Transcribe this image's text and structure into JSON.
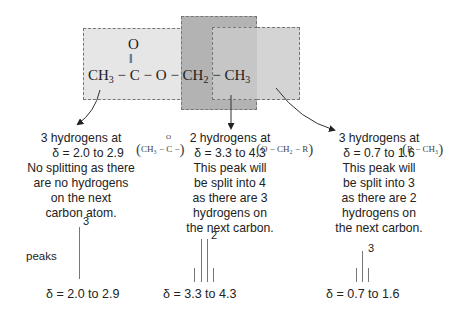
{
  "molecule": {
    "left_ch3": "CH",
    "left_ch3_sub": "3",
    "bond1": "−",
    "carbon": "C",
    "carbonyl_o": "O",
    "double_bond": "‖",
    "bond2": "−",
    "ester_o": "O",
    "bond3": "−",
    "ch2": "CH",
    "ch2_sub": "2",
    "bond4": "−",
    "right_ch3": "CH",
    "right_ch3_sub": "3"
  },
  "colors": {
    "light_box": "#e6e6e6",
    "dark_box": "#b3b3b3",
    "mid_box": "#d4d4d4",
    "dash": "#777777",
    "peak": "#777777"
  },
  "groups": [
    {
      "title": "3 hydrogens at",
      "delta_line": "δ = 2.0 to 2.9",
      "formula": "CH₃ − C −",
      "formula_top": "O",
      "lines": [
        "No splitting as there",
        "are no hydrogens",
        "on the next",
        "carbon atom."
      ],
      "peak_count_label": "3",
      "range": "δ = 2.0 to 2.9"
    },
    {
      "title": "2 hydrogens at",
      "delta_line": "δ = 3.3 to 4.3",
      "formula": "O − CH₂ − R",
      "lines": [
        "This peak will",
        "be split into 4",
        "as there are 3",
        "hydrogens on",
        "the next carbon."
      ],
      "peak_count_label": "2",
      "range": "δ = 3.3 to 4.3"
    },
    {
      "title": "3 hydrogens at",
      "delta_line": "δ = 0.7 to 1.6",
      "formula": "R − CH₃",
      "lines": [
        "This peak will",
        "be split into 3",
        "as there are 2",
        "hydrogens on",
        "the next carbon."
      ],
      "peak_count_label": "3",
      "range": "δ = 0.7 to 1.6"
    }
  ],
  "peaks_label": "peaks",
  "paren_open": "(",
  "paren_close": ")"
}
